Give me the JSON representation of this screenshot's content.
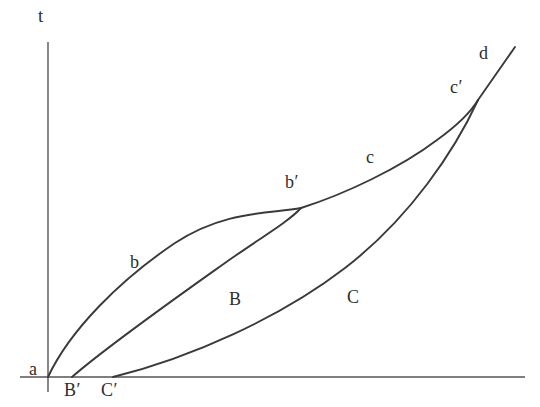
{
  "figure": {
    "type": "line-diagram",
    "background_color": "#ffffff",
    "stroke_color": "#3a3a3a",
    "axis_color": "#555555",
    "width": 540,
    "height": 407
  },
  "axes": {
    "vertical": {
      "label": "t",
      "x": 48,
      "y_top": 42,
      "y_bottom": 392
    },
    "horizontal": {
      "label": "",
      "y": 377,
      "x_left": 20,
      "x_right": 525
    }
  },
  "points": [
    {
      "name": "a",
      "label": "a",
      "x": 48,
      "y": 377
    },
    {
      "name": "Bp",
      "label": "B′",
      "x": 72,
      "y": 377
    },
    {
      "name": "Cp",
      "label": "C′",
      "x": 113,
      "y": 377
    },
    {
      "name": "bp",
      "label": "b′",
      "x": 301,
      "y": 208
    },
    {
      "name": "cp",
      "label": "c′",
      "x": 478,
      "y": 100
    },
    {
      "name": "d",
      "label": "d",
      "x": 515,
      "y": 47
    }
  ],
  "curves": [
    {
      "name": "curve-b",
      "label": "b",
      "from": "a",
      "to": "bp",
      "path": "M 48 377 C 70 330, 120 280, 175 243 C 225 210, 270 214, 301 208"
    },
    {
      "name": "curve-B",
      "label": "B",
      "from": "Bp",
      "to": "bp",
      "path": "M 72 377 C 110 344, 180 295, 232 258 C 270 232, 290 220, 301 208"
    },
    {
      "name": "curve-c",
      "label": "c",
      "from": "bp",
      "to": "cp",
      "path": "M 301 208 C 345 194, 400 168, 437 140 C 462 122, 472 110, 478 100"
    },
    {
      "name": "curve-C",
      "label": "C",
      "from": "Cp",
      "to": "cp",
      "path": "M 113 377 C 190 358, 280 318, 345 268 C 410 218, 455 150, 478 100"
    },
    {
      "name": "line-d",
      "label": "d",
      "from": "cp",
      "to": "d",
      "path": "M 478 100 L 515 47"
    }
  ],
  "labels": {
    "axis_t": "t",
    "a": "a",
    "B_prime": "B′",
    "C_prime": "C′",
    "b": "b",
    "b_prime": "b′",
    "c": "c",
    "c_prime": "c′",
    "d": "d",
    "B_cap": "B",
    "C_cap": "C"
  }
}
